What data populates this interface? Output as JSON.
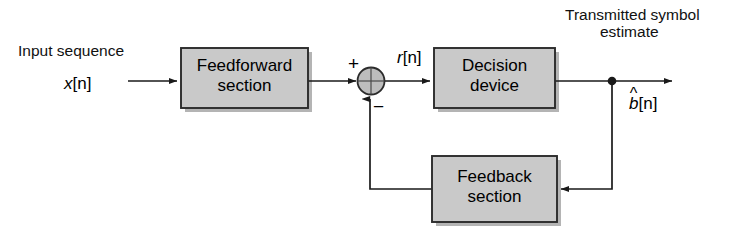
{
  "figure": {
    "type": "block-diagram",
    "background_color": "#ffffff",
    "block_fill": "#c9c9c9",
    "block_border": "#2b2b2b",
    "line_color": "#1a1a1a"
  },
  "labels": {
    "input_caption": "Input sequence",
    "input_signal": "x[n]",
    "input_signal_base": "x",
    "input_signal_index": "[n]",
    "sum_plus": "+",
    "sum_minus": "−",
    "mid_signal": "r[n]",
    "mid_signal_base": "r",
    "mid_signal_index": "[n]",
    "output_caption_line1": "Transmitted symbol",
    "output_caption_line2": "estimate",
    "output_signal": "b̂[n]",
    "output_signal_base": "b",
    "output_signal_hat": "^",
    "output_signal_index": "[n]"
  },
  "blocks": [
    {
      "id": "feedforward",
      "line1": "Feedforward",
      "line2": "section"
    },
    {
      "id": "decision",
      "line1": "Decision",
      "line2": "device"
    },
    {
      "id": "feedback",
      "line1": "Feedback",
      "line2": "section"
    }
  ],
  "nodes": {
    "summing_junction": "sum-junction",
    "tap_point": "output-tap-dot"
  },
  "connections": [
    {
      "from": "input",
      "to": "feedforward"
    },
    {
      "from": "feedforward",
      "to": "summing_junction"
    },
    {
      "from": "summing_junction",
      "to": "decision"
    },
    {
      "from": "decision",
      "to": "output"
    },
    {
      "from": "output_tap",
      "to": "feedback"
    },
    {
      "from": "feedback",
      "to": "summing_junction"
    }
  ]
}
